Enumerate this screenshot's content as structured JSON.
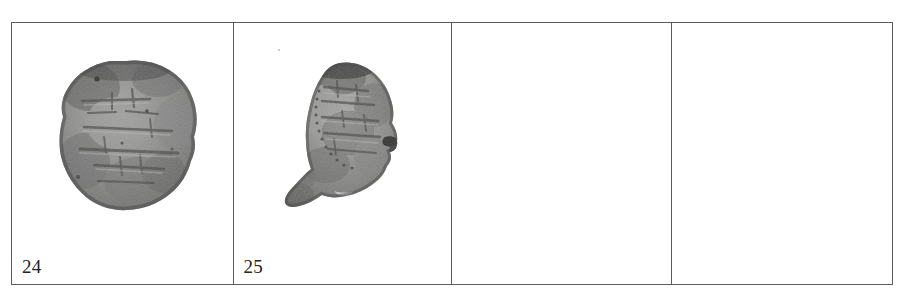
{
  "document": {
    "type": "archaeological-coin-plate",
    "background_color": "#ffffff",
    "border_color": "#5c5c5c"
  },
  "table": {
    "rows": 1,
    "columns": 4,
    "cells": [
      {
        "label": "24",
        "has_image": true,
        "image_name": "coin-24-photograph",
        "image_description": "grayscale photograph of a roughly circular worn silver coin with faint Kufic inscription lines",
        "shape": "round",
        "tone_dark": "#4a4a4a",
        "tone_mid": "#8d8d8d",
        "tone_light": "#c2c2c2"
      },
      {
        "label": "25",
        "has_image": true,
        "image_name": "coin-25-photograph",
        "image_description": "grayscale photograph of an irregular broken coin fragment with a pointed lower-left spur",
        "shape": "fragment",
        "tone_dark": "#4f4f4f",
        "tone_mid": "#909090",
        "tone_light": "#c4c4c4"
      },
      {
        "label": "",
        "has_image": false,
        "image_name": "",
        "image_description": "",
        "shape": "",
        "tone_dark": "",
        "tone_mid": "",
        "tone_light": ""
      },
      {
        "label": "",
        "has_image": false,
        "image_name": "",
        "image_description": "",
        "shape": "",
        "tone_dark": "",
        "tone_mid": "",
        "tone_light": ""
      }
    ]
  }
}
